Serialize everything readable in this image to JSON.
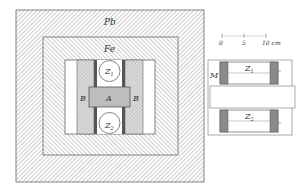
{
  "figure": {
    "type": "cross-section schematic",
    "left_view": {
      "layers": [
        {
          "label": "Pb",
          "material": "lead shielding"
        },
        {
          "label": "Fe",
          "material": "iron shielding"
        }
      ],
      "labels": {
        "z1": "Z",
        "z1_sub": "1",
        "z2": "Z",
        "z2_sub": "2",
        "a": "A",
        "b_left": "B",
        "b_right": "B"
      }
    },
    "right_view": {
      "labels": {
        "m": "M",
        "z1": "Z",
        "z1_sub": "1",
        "z2": "Z",
        "z2_sub": "2"
      },
      "scale_bar": {
        "ticks": [
          "0",
          "5",
          "10 cm"
        ]
      }
    }
  }
}
